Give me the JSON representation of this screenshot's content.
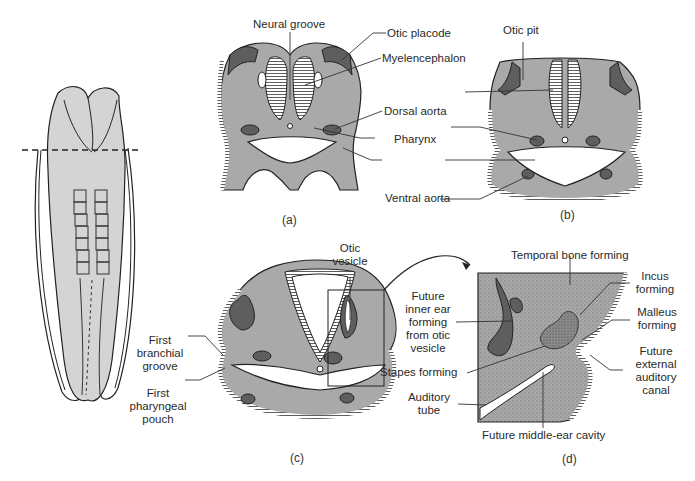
{
  "colors": {
    "tissue": "#a9a9a9",
    "tissue_light": "#d4d4d4",
    "dark_structure": "#5e5e5e",
    "outline": "#1f1f1f",
    "background": "#ffffff"
  },
  "panels": {
    "embryo": {
      "description": "dorsal view of embryo with dashed section line"
    },
    "a": {
      "caption": "(a)",
      "labels": {
        "neural_groove": "Neural groove",
        "otic_placode": "Otic placode",
        "myelencephalon": "Myelencephalon",
        "dorsal_aorta": "Dorsal aorta",
        "pharynx": "Pharynx",
        "ventral_aorta": "Ventral aorta"
      }
    },
    "b": {
      "caption": "(b)",
      "labels": {
        "otic_pit": "Otic pit"
      }
    },
    "c": {
      "caption": "(c)",
      "labels": {
        "otic_vesicle_1": "Otic",
        "otic_vesicle_2": "vesicle",
        "first_branchial_groove_1": "First",
        "first_branchial_groove_2": "branchial",
        "first_branchial_groove_3": "groove",
        "first_pharyngeal_pouch_1": "First",
        "first_pharyngeal_pouch_2": "pharyngeal",
        "first_pharyngeal_pouch_3": "pouch"
      }
    },
    "d": {
      "caption": "(d)",
      "labels": {
        "temporal_bone": "Temporal bone forming",
        "incus_1": "Incus",
        "incus_2": "forming",
        "malleus_1": "Malleus",
        "malleus_2": "forming",
        "future_ext_canal_1": "Future",
        "future_ext_canal_2": "external",
        "future_ext_canal_3": "auditory",
        "future_ext_canal_4": "canal",
        "inner_ear_1": "Future",
        "inner_ear_2": "inner ear",
        "inner_ear_3": "forming",
        "inner_ear_4": "from otic",
        "inner_ear_5": "vesicle",
        "stapes": "Stapes forming",
        "auditory_tube_1": "Auditory",
        "auditory_tube_2": "tube",
        "middle_ear": "Future middle-ear cavity"
      }
    }
  }
}
